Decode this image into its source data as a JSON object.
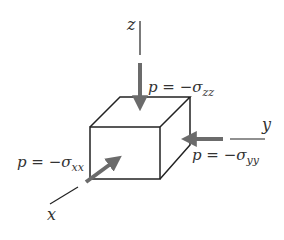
{
  "diagram": {
    "colors": {
      "line": "#222222",
      "arrow": "#6b6b6b",
      "text": "#333333"
    },
    "axes": {
      "z": {
        "label": "z"
      },
      "y": {
        "label": "y"
      },
      "x": {
        "label": "x"
      }
    },
    "loads": {
      "zz": {
        "p": "p = −σ",
        "sub": "zz"
      },
      "yy": {
        "p": "p = −σ",
        "sub": "yy"
      },
      "xx": {
        "p": "p = −σ",
        "sub": "xx"
      }
    }
  }
}
